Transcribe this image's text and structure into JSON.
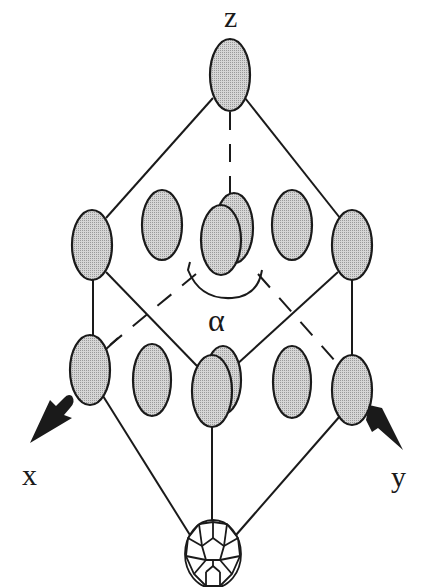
{
  "figure": {
    "labels": {
      "z_axis": "z",
      "x_axis": "x",
      "y_axis": "y",
      "angle": "α"
    },
    "colors": {
      "ellipse_fill": "#c8c8c8",
      "stroke": "#1a1a1a",
      "arrow": "#1a1a1a",
      "background": "#ffffff"
    },
    "molecules": [
      {
        "id": "top-vertex",
        "cx": 230,
        "cy": 75,
        "rx": 20,
        "ry": 35
      },
      {
        "id": "upper-left-vertex",
        "cx": 92,
        "cy": 245,
        "rx": 20,
        "ry": 35
      },
      {
        "id": "upper-mid-left",
        "cx": 162,
        "cy": 225,
        "rx": 20,
        "ry": 35
      },
      {
        "id": "upper-center-back",
        "cx": 234,
        "cy": 228,
        "rx": 19,
        "ry": 35
      },
      {
        "id": "upper-center-front",
        "cx": 221,
        "cy": 240,
        "rx": 20,
        "ry": 35
      },
      {
        "id": "upper-mid-right",
        "cx": 292,
        "cy": 225,
        "rx": 20,
        "ry": 35
      },
      {
        "id": "upper-right-vertex",
        "cx": 352,
        "cy": 245,
        "rx": 20,
        "ry": 35
      },
      {
        "id": "lower-left-vertex",
        "cx": 90,
        "cy": 370,
        "rx": 20,
        "ry": 35
      },
      {
        "id": "lower-mid-left",
        "cx": 152,
        "cy": 380,
        "rx": 19,
        "ry": 35
      },
      {
        "id": "lower-center-back",
        "cx": 223,
        "cy": 380,
        "rx": 18,
        "ry": 34
      },
      {
        "id": "lower-center-front",
        "cx": 212,
        "cy": 391,
        "rx": 20,
        "ry": 36
      },
      {
        "id": "lower-mid-right",
        "cx": 292,
        "cy": 382,
        "rx": 19,
        "ry": 36
      },
      {
        "id": "lower-right-vertex",
        "cx": 352,
        "cy": 390,
        "rx": 20,
        "ry": 35
      }
    ],
    "fullerene": {
      "id": "c60-bottom-vertex",
      "cx": 213,
      "cy": 554,
      "rx": 28,
      "ry": 34
    }
  }
}
